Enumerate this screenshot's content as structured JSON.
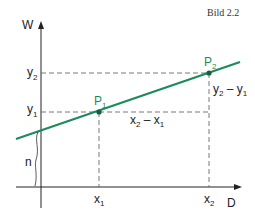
{
  "caption": "Bild 2.2",
  "axes": {
    "y_label": "W",
    "x_label": "D"
  },
  "points": [
    {
      "name": "P",
      "sub": "1"
    },
    {
      "name": "P",
      "sub": "2"
    }
  ],
  "ticks": {
    "y1": {
      "base": "y",
      "sub": "1"
    },
    "y2": {
      "base": "y",
      "sub": "2"
    },
    "x1": {
      "base": "x",
      "sub": "1"
    },
    "x2": {
      "base": "x",
      "sub": "2"
    }
  },
  "annotations": {
    "dx": {
      "a": "x",
      "a_sub": "2",
      "op": " – ",
      "b": "x",
      "b_sub": "1"
    },
    "dy": {
      "a": "y",
      "a_sub": "2",
      "op": " – ",
      "b": "y",
      "b_sub": "1"
    },
    "intercept": "n"
  },
  "colors": {
    "line": "#1e8a5a",
    "axis": "#222222",
    "dashed": "#555555"
  }
}
